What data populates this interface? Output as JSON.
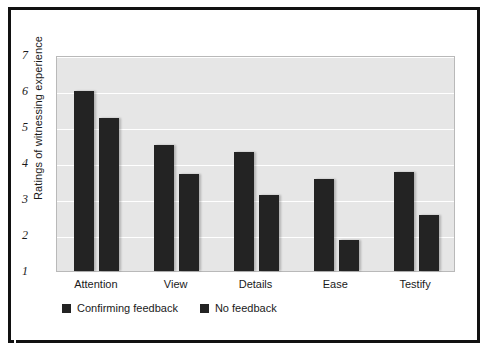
{
  "chart_data": {
    "type": "bar",
    "title": "",
    "subtitle": "",
    "xlabel": "",
    "ylabel": "Ratings of witnessing experience",
    "categories": [
      "Attention",
      "View",
      "Details",
      "Ease",
      "Testify"
    ],
    "series": [
      {
        "name": "Confirming feedback",
        "values": [
          6.0,
          4.5,
          4.3,
          3.55,
          3.75
        ],
        "color": "#232323"
      },
      {
        "name": "No feedback",
        "values": [
          5.25,
          3.7,
          3.1,
          1.85,
          2.55
        ],
        "color": "#232323"
      }
    ],
    "ylim": [
      1,
      7
    ],
    "yticks": [
      1,
      2,
      3,
      4,
      5,
      6,
      7
    ],
    "ytick_labels": [
      "1",
      "2",
      "3",
      "4",
      "5",
      "6",
      "7"
    ],
    "grid": "horizontal",
    "legend_position": "bottom-left",
    "plot_background": "#e6e6e6",
    "gridline_color": "#ffffff",
    "frame_color": "#111111"
  },
  "legend": {
    "items": [
      {
        "label": "Confirming feedback",
        "swatch": "legend-swatch-confirming"
      },
      {
        "label": "No feedback",
        "swatch": "legend-swatch-no-feedback"
      }
    ]
  }
}
